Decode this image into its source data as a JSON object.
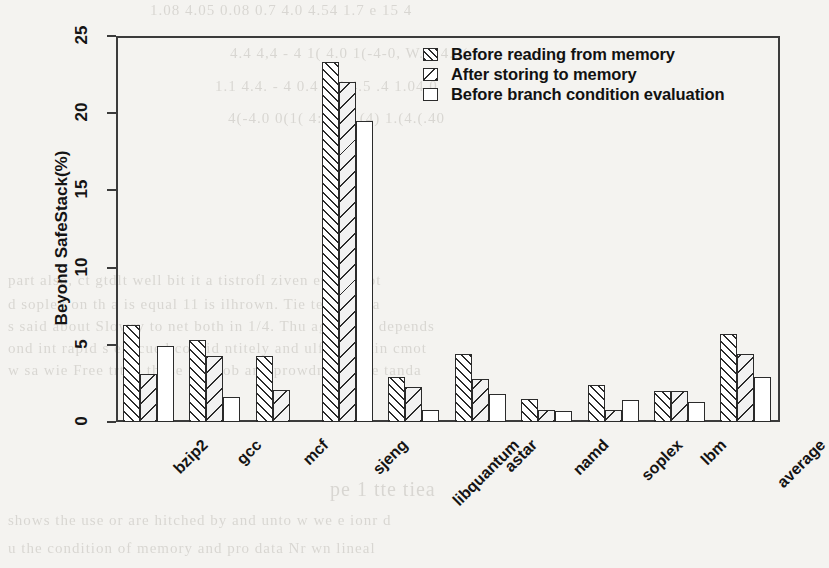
{
  "chart_data": {
    "type": "bar",
    "title": "",
    "xlabel": "",
    "ylabel": "Beyond SafeStack(%)",
    "ylim": [
      0,
      25
    ],
    "yticks": [
      0,
      5,
      10,
      15,
      20,
      25
    ],
    "grid": false,
    "legend_position": "top-right",
    "categories": [
      "bzip2",
      "gcc",
      "mcf",
      "sjeng",
      "libquantum",
      "astar",
      "namd",
      "soplex",
      "lbm",
      "average"
    ],
    "series": [
      {
        "name": "Before reading from memory",
        "pattern": "diagonal-up-dense",
        "values": [
          6.3,
          5.3,
          4.3,
          23.3,
          2.9,
          4.4,
          1.5,
          2.4,
          2.0,
          5.7
        ]
      },
      {
        "name": "After storing to memory",
        "pattern": "diagonal-down-sparse",
        "values": [
          3.1,
          4.3,
          2.1,
          22.0,
          2.3,
          2.8,
          0.75,
          0.75,
          2.0,
          4.4
        ]
      },
      {
        "name": "Before branch condition evaluation",
        "pattern": "solid-white",
        "values": [
          4.9,
          1.6,
          0.0,
          19.5,
          0.8,
          1.8,
          0.7,
          1.4,
          1.3,
          2.9
        ]
      }
    ]
  },
  "axis": {
    "y_title": "Beyond SafeStack(%)",
    "y_tick_labels": [
      "0",
      "5",
      "10",
      "15",
      "20",
      "25"
    ]
  },
  "legend": {
    "entries": [
      {
        "label": "Before reading from memory",
        "swatch": "hatch-a"
      },
      {
        "label": "After storing to memory",
        "swatch": "hatch-b"
      },
      {
        "label": "Before branch condition evaluation",
        "swatch": "hatch-c"
      }
    ]
  },
  "page_bleed": {
    "lines": [
      {
        "text": "1.08  4.05     0.08  0.7   4.0      4.54  1.7 e    15   4",
        "x": 150,
        "y": 2,
        "size": 15
      },
      {
        "text": "4.4    4,4 - 4      1( 4.0     1(-4-0,   W.-( 4.0(",
        "x": 230,
        "y": 45,
        "size": 15
      },
      {
        "text": "1.1        4.4. - 4      0.4    1.4      4.5  .4   1.04   0",
        "x": 215,
        "y": 78,
        "size": 15
      },
      {
        "text": "4(-4.0    0(1( 4:.- 4     1(4) 1.(4.(.40",
        "x": 228,
        "y": 110,
        "size": 15
      },
      {
        "text": "part also,  ct gtdlt well bit it a tistrofl ziven  et a   aboot",
        "x": 8,
        "y": 272,
        "size": 15
      },
      {
        "text": "d soplex   on th a is equal  11 is ilhrown. Tie te to  the a",
        "x": 8,
        "y": 296,
        "size": 15
      },
      {
        "text": "s said about  Slowry  to net both  in 1/4. Thu agd astar depends",
        "x": 8,
        "y": 318,
        "size": 15
      },
      {
        "text": "ond int rapid s execued consid ntitely  and ulfficont tin cmot",
        "x": 8,
        "y": 340,
        "size": 15
      },
      {
        "text": "w sa wie  Free trtho those  ehiklob  amoprowdnes ad re  tanda",
        "x": 8,
        "y": 362,
        "size": 15
      },
      {
        "text": "shows the use or  are hitched  by  and    unto  w we  e ionr   d",
        "x": 8,
        "y": 512,
        "size": 15
      },
      {
        "text": "u the  condition  of memory   and pro data  Nr wn   lineal",
        "x": 8,
        "y": 540,
        "size": 15
      },
      {
        "text": "pe  1   tte  tiea",
        "x": 330,
        "y": 478,
        "size": 20
      }
    ]
  }
}
